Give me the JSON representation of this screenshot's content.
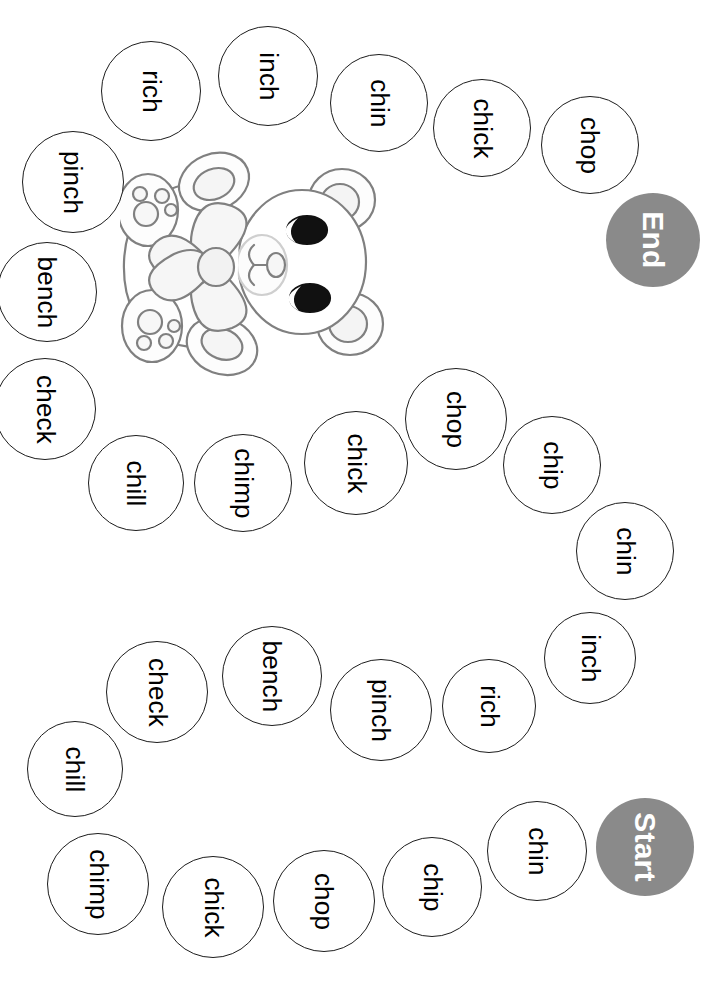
{
  "worksheet": {
    "theme_sound": "ch",
    "start_label": "Start",
    "end_label": "End",
    "marker_color": "#8a8a8a",
    "circle_outline_color": "#1c1c1c",
    "artwork": {
      "name": "teddy-bear-with-bow",
      "outline_color": "#808080",
      "eye_color": "#000000"
    },
    "spaces": [
      {
        "label": "Start",
        "kind": "marker",
        "cx": 645,
        "cy": 847,
        "r": 49
      },
      {
        "label": "chin",
        "kind": "word",
        "cx": 537,
        "cy": 851,
        "r": 50
      },
      {
        "label": "chip",
        "kind": "word",
        "cx": 432,
        "cy": 887,
        "r": 50
      },
      {
        "label": "chop",
        "kind": "word",
        "cx": 324,
        "cy": 901,
        "r": 51
      },
      {
        "label": "chick",
        "kind": "word",
        "cx": 213,
        "cy": 907,
        "r": 51
      },
      {
        "label": "chimp",
        "kind": "word",
        "cx": 98,
        "cy": 884,
        "r": 51
      },
      {
        "label": "chill",
        "kind": "word",
        "cx": 75,
        "cy": 769,
        "r": 48
      },
      {
        "label": "check",
        "kind": "word",
        "cx": 157,
        "cy": 692,
        "r": 51
      },
      {
        "label": "bench",
        "kind": "word",
        "cx": 272,
        "cy": 676,
        "r": 50
      },
      {
        "label": "pinch",
        "kind": "word",
        "cx": 381,
        "cy": 710,
        "r": 51
      },
      {
        "label": "rich",
        "kind": "word",
        "cx": 489,
        "cy": 706,
        "r": 47
      },
      {
        "label": "inch",
        "kind": "word",
        "cx": 590,
        "cy": 658,
        "r": 46
      },
      {
        "label": "chin",
        "kind": "word",
        "cx": 625,
        "cy": 551,
        "r": 49
      },
      {
        "label": "chip",
        "kind": "word",
        "cx": 552,
        "cy": 465,
        "r": 49
      },
      {
        "label": "chop",
        "kind": "word",
        "cx": 456,
        "cy": 419,
        "r": 51
      },
      {
        "label": "chick",
        "kind": "word",
        "cx": 356,
        "cy": 463,
        "r": 52
      },
      {
        "label": "chimp",
        "kind": "word",
        "cx": 243,
        "cy": 483,
        "r": 49
      },
      {
        "label": "chill",
        "kind": "word",
        "cx": 136,
        "cy": 483,
        "r": 48
      },
      {
        "label": "check",
        "kind": "word",
        "cx": 45,
        "cy": 409,
        "r": 51
      },
      {
        "label": "bench",
        "kind": "word",
        "cx": 47,
        "cy": 292,
        "r": 50
      },
      {
        "label": "pinch",
        "kind": "word",
        "cx": 73,
        "cy": 182,
        "r": 51
      },
      {
        "label": "rich",
        "kind": "word",
        "cx": 151,
        "cy": 91,
        "r": 50
      },
      {
        "label": "inch",
        "kind": "word",
        "cx": 268,
        "cy": 76,
        "r": 50
      },
      {
        "label": "chin",
        "kind": "word",
        "cx": 379,
        "cy": 103,
        "r": 49
      },
      {
        "label": "chick",
        "kind": "word",
        "cx": 482,
        "cy": 128,
        "r": 49
      },
      {
        "label": "chop",
        "kind": "word",
        "cx": 590,
        "cy": 145,
        "r": 49
      },
      {
        "label": "End",
        "kind": "marker",
        "cx": 653,
        "cy": 240,
        "r": 47
      }
    ]
  }
}
